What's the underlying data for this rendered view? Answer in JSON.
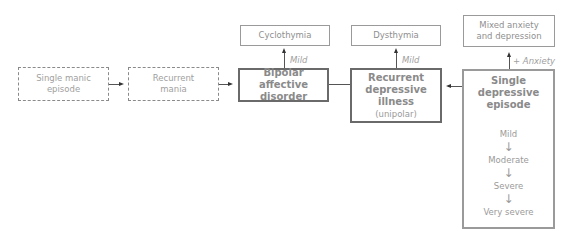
{
  "nodes": {
    "single_manic": {
      "line1": "Single manic",
      "line2": "episode"
    },
    "recurrent_mania": {
      "line1": "Recurrent",
      "line2": "mania"
    },
    "bipolar": {
      "line1": "Bipolar affective",
      "line2": "disorder"
    },
    "cyclothymia": {
      "label": "Cyclothymia"
    },
    "recurrent_depressive": {
      "line1": "Recurrent",
      "line2": "depressive",
      "line3": "illness",
      "sub": "(unipolar)"
    },
    "dysthymia": {
      "label": "Dysthymia"
    },
    "mixed": {
      "line1": "Mixed anxiety",
      "line2": "and depression"
    },
    "single_depressive": {
      "line1": "Single depressive",
      "line2": "episode",
      "severity": [
        "Mild",
        "Moderate",
        "Severe",
        "Very severe"
      ],
      "arrow": "↓"
    }
  },
  "edge_labels": {
    "bipolar_to_cyclothymia": "Mild",
    "recurrent_to_dysthymia": "Mild",
    "single_to_mixed": "+ Anxiety"
  }
}
